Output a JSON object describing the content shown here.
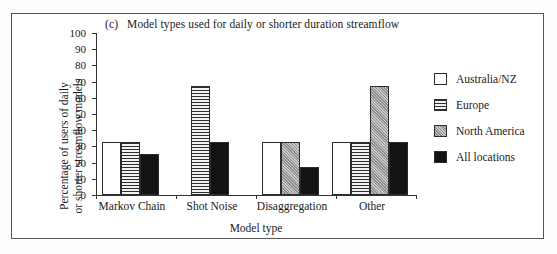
{
  "figure": {
    "panel_tag": "(c)",
    "title": "Model types used for daily or shorter duration streamflow"
  },
  "chart_data": {
    "type": "bar",
    "xlabel": "Model type",
    "ylabel": "Percentage of users of daily or shorter streamflow models",
    "ylabel_line1": "Percentage of users of daily",
    "ylabel_line2": "or shorter streamflow models",
    "ylim": [
      0,
      100
    ],
    "yticks": [
      0,
      10,
      20,
      30,
      40,
      50,
      60,
      70,
      80,
      90,
      100
    ],
    "grid": false,
    "legend_position": "right",
    "categories": [
      "Markov Chain",
      "Shot Noise",
      "Disaggregation",
      "Other"
    ],
    "series": [
      {
        "name": "Australia/NZ",
        "pattern": "white",
        "values": [
          33,
          null,
          33,
          33
        ]
      },
      {
        "name": "Europe",
        "pattern": "hline",
        "values": [
          33,
          67,
          null,
          33
        ]
      },
      {
        "name": "North America",
        "pattern": "stipple",
        "values": [
          null,
          null,
          33,
          67
        ]
      },
      {
        "name": "All locations",
        "pattern": "black",
        "values": [
          25,
          33,
          17,
          33
        ]
      }
    ]
  },
  "legend": {
    "entries": [
      {
        "label": "Australia/NZ",
        "pattern": "white"
      },
      {
        "label": "Europe",
        "pattern": "hline"
      },
      {
        "label": "North America",
        "pattern": "stipple"
      },
      {
        "label": "All locations",
        "pattern": "black"
      }
    ]
  },
  "colors": {
    "frame": "#555555",
    "axis": "#333333",
    "black_bar": "#131313",
    "gray_bar": "#b0b0b0",
    "background": "#ffffff"
  }
}
